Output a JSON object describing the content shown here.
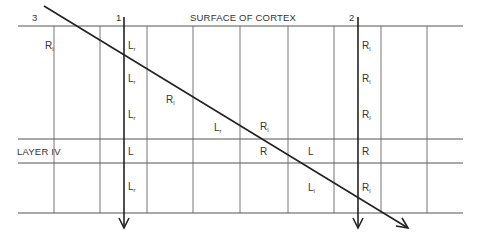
{
  "diagram": {
    "title": "SURFACE OF CORTEX",
    "layer_label": "LAYER IV",
    "colors": {
      "line": "#333333",
      "grid": "#555555",
      "text": "#333333",
      "background": "#ffffff"
    },
    "electrodes": [
      {
        "id": "1",
        "label": "1",
        "type": "perpendicular"
      },
      {
        "id": "2",
        "label": "2",
        "type": "perpendicular"
      },
      {
        "id": "3",
        "label": "3",
        "type": "oblique"
      }
    ],
    "columns_x": [
      54,
      100,
      147,
      193,
      240,
      288,
      334,
      381,
      427
    ],
    "rows_y": [
      26,
      139,
      163,
      213
    ],
    "labels": [
      {
        "base": "R",
        "sub": "l",
        "x": 45,
        "y": 41
      },
      {
        "base": "L",
        "sub": "r",
        "x": 128,
        "y": 41
      },
      {
        "base": "L",
        "sub": "r",
        "x": 128,
        "y": 74
      },
      {
        "base": "R",
        "sub": "l",
        "x": 166,
        "y": 95
      },
      {
        "base": "L",
        "sub": "r",
        "x": 128,
        "y": 110
      },
      {
        "base": "L",
        "sub": "r",
        "x": 214,
        "y": 123
      },
      {
        "base": "R",
        "sub": "l",
        "x": 260,
        "y": 122
      },
      {
        "base": "L",
        "sub": "",
        "x": 128,
        "y": 147
      },
      {
        "base": "R",
        "sub": "",
        "x": 260,
        "y": 147
      },
      {
        "base": "L",
        "sub": "",
        "x": 308,
        "y": 147
      },
      {
        "base": "R",
        "sub": "",
        "x": 362,
        "y": 147
      },
      {
        "base": "L",
        "sub": "r",
        "x": 128,
        "y": 182
      },
      {
        "base": "L",
        "sub": "l",
        "x": 308,
        "y": 183
      },
      {
        "base": "R",
        "sub": "l",
        "x": 362,
        "y": 183
      },
      {
        "base": "R",
        "sub": "l",
        "x": 362,
        "y": 41
      },
      {
        "base": "R",
        "sub": "l",
        "x": 362,
        "y": 74
      },
      {
        "base": "R",
        "sub": "l",
        "x": 362,
        "y": 110
      }
    ]
  }
}
